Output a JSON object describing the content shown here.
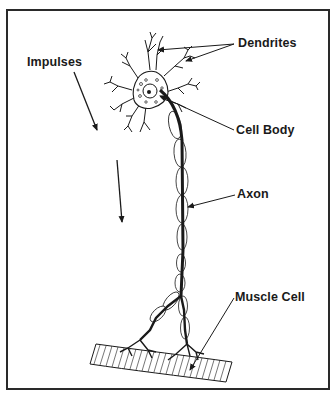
{
  "diagram": {
    "labels": {
      "dendrites": "Dendrites",
      "impulses": "Impulses",
      "cell_body": "Cell Body",
      "axon": "Axon",
      "muscle_cell": "Muscle Cell"
    },
    "colors": {
      "line": "#1a1a1a",
      "background": "#ffffff",
      "frame": "#2a2a2a"
    }
  }
}
